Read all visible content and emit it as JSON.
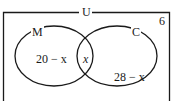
{
  "diagram": {
    "type": "venn",
    "universe_label": "U",
    "outside_value": "6",
    "sets": [
      {
        "label": "M",
        "only_value": "20 − x"
      },
      {
        "label": "C",
        "only_value": "28 − x"
      }
    ],
    "intersection_value": "x"
  }
}
